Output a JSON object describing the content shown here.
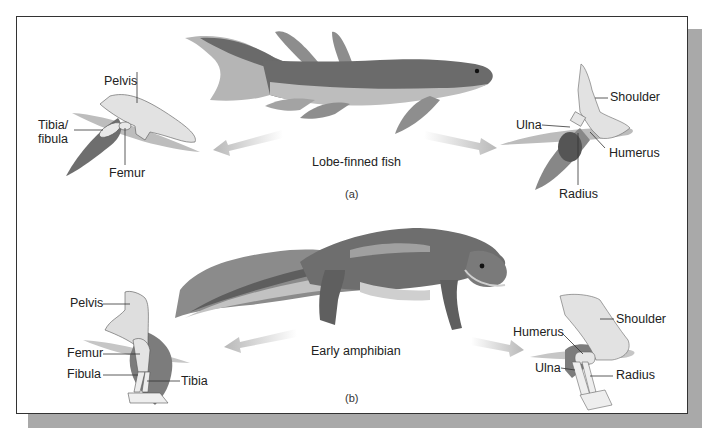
{
  "figure": {
    "panels": [
      {
        "id": "a",
        "panel_label": "(a)",
        "organism": "Lobe-finned fish",
        "hind_limb": {
          "labels": [
            "Pelvis",
            "Tibia/\nfibula",
            "Femur"
          ]
        },
        "fore_limb": {
          "labels": [
            "Shoulder",
            "Ulna",
            "Humerus",
            "Radius"
          ]
        }
      },
      {
        "id": "b",
        "panel_label": "(b)",
        "organism": "Early amphibian",
        "hind_limb": {
          "labels": [
            "Pelvis",
            "Femur",
            "Fibula",
            "Tibia"
          ]
        },
        "fore_limb": {
          "labels": [
            "Shoulder",
            "Humerus",
            "Ulna",
            "Radius"
          ]
        }
      }
    ],
    "colors": {
      "body_dark": "#5e5e5e",
      "body_mid": "#8a8a8a",
      "body_light": "#b9b9b9",
      "bone": "#e3e3e3",
      "arrow": "#c4c4c4",
      "shadow": "#a9a9a9"
    }
  }
}
